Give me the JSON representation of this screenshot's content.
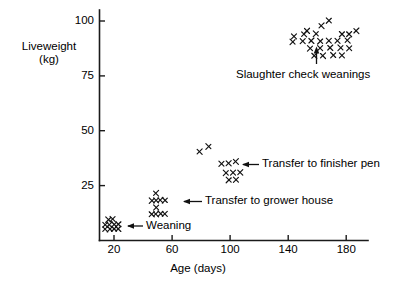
{
  "chart_data": {
    "type": "scatter",
    "title": "",
    "xlabel": "Age (days)",
    "ylabel_line1": "Liveweight",
    "ylabel_line2": "(kg)",
    "xlim": [
      10,
      195
    ],
    "ylim": [
      0,
      105
    ],
    "xticks": [
      20,
      60,
      100,
      140,
      180
    ],
    "yticks": [
      25,
      50,
      75,
      100
    ],
    "grid": false,
    "legend": "none",
    "marker": "x",
    "series": [
      {
        "name": "Pig liveweight by age",
        "points": [
          [
            16,
            9.5
          ],
          [
            19,
            9.8
          ],
          [
            14,
            7.2
          ],
          [
            17,
            7.2
          ],
          [
            20,
            7.3
          ],
          [
            23,
            7.4
          ],
          [
            14,
            5.2
          ],
          [
            17,
            5.2
          ],
          [
            20,
            5.3
          ],
          [
            23,
            5.3
          ],
          [
            49,
            21.5
          ],
          [
            46,
            18.2
          ],
          [
            49,
            18.3
          ],
          [
            52,
            18.4
          ],
          [
            55,
            18.3
          ],
          [
            49,
            15.0
          ],
          [
            46,
            12.0
          ],
          [
            49,
            12.1
          ],
          [
            52,
            12.2
          ],
          [
            55,
            12.1
          ],
          [
            79,
            40.5
          ],
          [
            85,
            42.8
          ],
          [
            94,
            35.0
          ],
          [
            99,
            35.2
          ],
          [
            104,
            36.0
          ],
          [
            97,
            30.8
          ],
          [
            102,
            30.9
          ],
          [
            107,
            31.0
          ],
          [
            99,
            27.6
          ],
          [
            104,
            27.7
          ],
          [
            153,
            95.5
          ],
          [
            163,
            97.8
          ],
          [
            168,
            100.2
          ],
          [
            144,
            93.0
          ],
          [
            151,
            94.0
          ],
          [
            159,
            94.2
          ],
          [
            177,
            94.0
          ],
          [
            182,
            94.0
          ],
          [
            187,
            95.5
          ],
          [
            143,
            90.5
          ],
          [
            150,
            90.8
          ],
          [
            156,
            91.0
          ],
          [
            162,
            90.8
          ],
          [
            168,
            91.0
          ],
          [
            174,
            91.0
          ],
          [
            181,
            91.2
          ],
          [
            155,
            87.5
          ],
          [
            162,
            87.6
          ],
          [
            169,
            87.8
          ],
          [
            176,
            87.8
          ],
          [
            182,
            87.6
          ],
          [
            158,
            84.2
          ],
          [
            164,
            84.2
          ],
          [
            171,
            84.4
          ],
          [
            177,
            84.3
          ]
        ]
      }
    ],
    "annotations": [
      {
        "id": "weaning",
        "label": "Weaning",
        "arrow": "left"
      },
      {
        "id": "transfer-grower",
        "label": "Transfer to grower house",
        "arrow": "left"
      },
      {
        "id": "transfer-finisher",
        "label": "Transfer to finisher pen",
        "arrow": "left"
      },
      {
        "id": "slaughter",
        "label": "Slaughter check weanings",
        "arrow": "up"
      }
    ],
    "colors": {
      "axis": "#1a1a1a",
      "marker": "#111111",
      "text": "#000000",
      "background": "#ffffff"
    }
  }
}
